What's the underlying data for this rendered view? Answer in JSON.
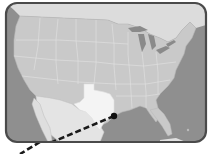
{
  "map": {
    "region": "United States",
    "highlighted_state": "Texas",
    "marker": {
      "label": "Houston",
      "x": 114,
      "y": 116
    },
    "route_line": {
      "style": "dashed",
      "from": [
        114,
        116
      ],
      "to": [
        22,
        154
      ]
    },
    "colors": {
      "frame_border": "#4a4a4a",
      "ocean": "#8f8f8f",
      "land": "#c9c9c9",
      "state_border": "#e0e0e0",
      "highlight": "#f4f4f4",
      "mexico": "#e4e4e4",
      "lakes": "#8a8a8a",
      "marker": "#111111",
      "route": "#1a1a1a"
    }
  }
}
